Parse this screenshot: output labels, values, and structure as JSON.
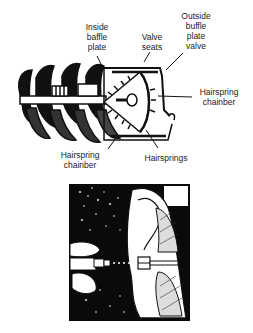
{
  "figure": {
    "top_diagram": {
      "description": "Cutaway drawing of a cochlea-like mechanism with spiral screw, baffle plates, valve seats and hairsprings",
      "labels": [
        {
          "id": "inside-baffle-plate",
          "text": "Inside\nbaffle\nplate"
        },
        {
          "id": "valve-seats",
          "text": "Valve\nseats"
        },
        {
          "id": "outside-buffle-plate-valve",
          "text": "Outside\nbuffle\nplate\nvalve"
        },
        {
          "id": "hairspring-chainber-right",
          "text": "Hairspring\nchainber"
        },
        {
          "id": "hairspring-chainber-bottom",
          "text": "Hairspring\nchainber"
        },
        {
          "id": "hairsprings",
          "text": "Hairsprings"
        }
      ]
    },
    "bottom_diagram": {
      "description": "Black-and-white illustration of an ear with a device inserted into the ear canal against a starry dark background"
    }
  }
}
